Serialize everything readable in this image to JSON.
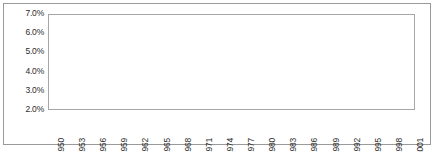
{
  "figure": {
    "caption": ""
  },
  "chart_data": {
    "type": "line",
    "title": "",
    "subtitle": "",
    "xlabel": "",
    "ylabel": "",
    "grid": "horizontal",
    "legend": "none",
    "marker": "filled-circle",
    "line_color": "#000000",
    "marker_color": "#000000",
    "ylim": [
      2.0,
      7.0
    ],
    "ytick_values": [
      7.0,
      6.0,
      5.0,
      4.0,
      3.0,
      2.0
    ],
    "ytick_labels": [
      "7.0%",
      "6.0%",
      "5.0%",
      "4.0%",
      "3.0%",
      "2.0%"
    ],
    "xlim": [
      1950,
      2001
    ],
    "xtick_labels": [
      "1950",
      "1953",
      "1956",
      "1959",
      "1962",
      "1965",
      "1968",
      "1971",
      "1974",
      "1977",
      "1980",
      "1983",
      "1986",
      "1989",
      "1992",
      "1995",
      "1998",
      "2001"
    ],
    "x": [
      1950,
      1951,
      1952,
      1953,
      1954,
      1955,
      1956,
      1957,
      1958,
      1959,
      1960,
      1961,
      1962,
      1963,
      1964,
      1965,
      1966,
      1967,
      1968,
      1969,
      1970,
      1971,
      1972,
      1973,
      1974,
      1975,
      1976,
      1977,
      1978,
      1979,
      1980,
      1981,
      1982,
      1983,
      1984,
      1985,
      1986,
      1987,
      1988,
      1989,
      1990,
      1991,
      1992,
      1993,
      1994,
      1995,
      1996,
      1997,
      1998,
      1999,
      2000,
      2001
    ],
    "values": [
      4.2,
      3.95,
      4.0,
      4.05,
      4.1,
      4.3,
      4.35,
      4.45,
      4.5,
      4.7,
      4.55,
      4.6,
      4.55,
      4.45,
      4.4,
      4.35,
      4.3,
      4.2,
      4.15,
      4.1,
      4.05,
      4.05,
      4.1,
      4.05,
      4.0,
      4.6,
      4.65,
      4.65,
      4.45,
      5.2,
      5.85,
      5.85,
      5.75,
      5.5,
      5.25,
      4.65,
      4.5,
      4.45,
      4.4,
      4.35,
      4.3,
      4.2,
      4.2,
      4.15,
      4.1,
      4.15,
      4.1,
      3.85,
      3.8,
      3.85,
      4.0,
      4.0
    ],
    "series": [
      {
        "name": "series-1",
        "values": [
          4.2,
          3.95,
          4.0,
          4.05,
          4.1,
          4.3,
          4.35,
          4.45,
          4.5,
          4.7,
          4.55,
          4.6,
          4.55,
          4.45,
          4.4,
          4.35,
          4.3,
          4.2,
          4.15,
          4.1,
          4.05,
          4.05,
          4.1,
          4.05,
          4.0,
          4.6,
          4.65,
          4.65,
          4.45,
          5.2,
          5.85,
          5.85,
          5.75,
          5.5,
          5.25,
          4.65,
          4.5,
          4.45,
          4.4,
          4.35,
          4.3,
          4.2,
          4.2,
          4.15,
          4.1,
          4.15,
          4.1,
          3.85,
          3.8,
          3.85,
          4.0,
          4.0
        ]
      }
    ]
  }
}
